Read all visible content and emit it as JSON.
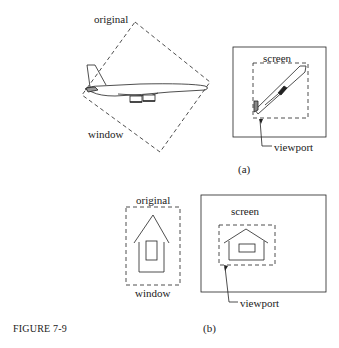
{
  "figure": {
    "caption": "FIGURE 7-9",
    "colors": {
      "ink": "#222222",
      "background": "#ffffff"
    }
  },
  "part_a": {
    "tag": "(a)",
    "original_label": "original",
    "window_label": "window",
    "screen_label": "screen",
    "viewport_label": "viewport",
    "object": "airplane"
  },
  "part_b": {
    "tag": "(b)",
    "original_label": "original",
    "window_label": "window",
    "screen_label": "screen",
    "viewport_label": "viewport",
    "object": "house"
  }
}
